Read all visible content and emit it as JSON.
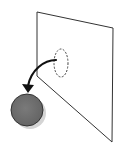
{
  "diagram": {
    "elements": [
      {
        "id": "plane",
        "type": "parallelogram",
        "label": ""
      },
      {
        "id": "region",
        "type": "dashed-ellipse",
        "label": ""
      },
      {
        "id": "arrow",
        "type": "curved-arrow",
        "from": "region",
        "to": "sphere",
        "label": ""
      },
      {
        "id": "sphere",
        "type": "circle",
        "label": ""
      }
    ],
    "colors": {
      "stroke": "#333333",
      "sphere_fill": "#707070",
      "sphere_shadow": "#cfcfcf",
      "background": "#ffffff"
    }
  }
}
